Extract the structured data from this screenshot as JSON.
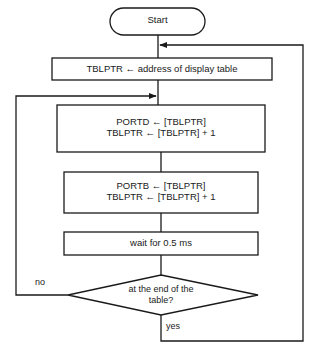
{
  "diagram": {
    "colors": {
      "stroke": "#1a1a1a",
      "fill": "#ffffff",
      "text": "#1a1a1a",
      "background": "#ffffff"
    },
    "nodes": [
      {
        "id": "start",
        "shape": "terminal",
        "label": "Start"
      },
      {
        "id": "init-tblptr",
        "shape": "process",
        "label": "TBLPTR ← address of display table"
      },
      {
        "id": "write-portd",
        "shape": "process",
        "label": "PORTD ← [TBLPTR]\nTBLPTR  ← [TBLPTR] + 1"
      },
      {
        "id": "write-portb",
        "shape": "process",
        "label": "PORTB ← [TBLPTR]\nTBLPTR  ← [TBLPTR] + 1"
      },
      {
        "id": "wait",
        "shape": "process",
        "label": "wait for 0.5 ms"
      },
      {
        "id": "end-of-table",
        "shape": "decision",
        "label": "at the end of the\ntable?"
      }
    ],
    "edge_labels": {
      "no": "no",
      "yes": "yes"
    }
  }
}
